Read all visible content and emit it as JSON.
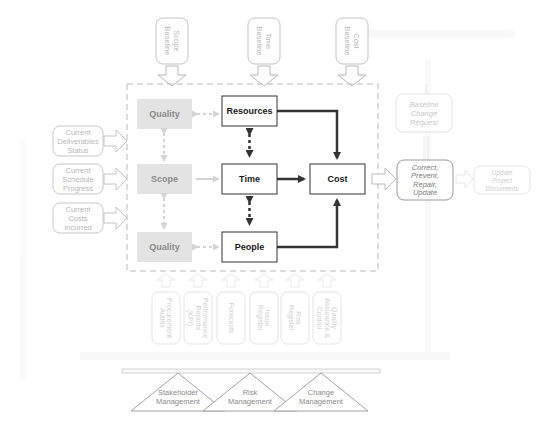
{
  "diagram": {
    "baselines": [
      {
        "label_line1": "Scope",
        "label_line2": "Baseline"
      },
      {
        "label_line1": "Time",
        "label_line2": "Baseline"
      },
      {
        "label_line1": "Cost",
        "label_line2": "Baseline"
      }
    ],
    "inputs": [
      {
        "lines": [
          "Current",
          "Deliverables",
          "Status"
        ]
      },
      {
        "lines": [
          "Current",
          "Schedule",
          "Progress"
        ]
      },
      {
        "lines": [
          "Current",
          "Costs",
          "Incurred"
        ]
      }
    ],
    "constraints": {
      "quality_top": "Quality",
      "scope": "Scope",
      "quality_bottom": "Quality"
    },
    "core": {
      "resources": "Resources",
      "time": "Time",
      "people": "People",
      "cost": "Cost"
    },
    "outputs": {
      "baseline_change_request": [
        "Baseline",
        "Change",
        "Request"
      ],
      "correct_prevent": [
        "Correct,",
        "Prevent,",
        "Repair,",
        "Update"
      ],
      "update_documents": [
        "Update",
        "Project",
        "Documents"
      ]
    },
    "tools": [
      {
        "lines": [
          "Procurement",
          "Audits"
        ]
      },
      {
        "lines": [
          "Performance",
          "Reports",
          "(KPI)"
        ]
      },
      {
        "lines": [
          "Forecasts"
        ]
      },
      {
        "lines": [
          "Issue",
          "Register"
        ]
      },
      {
        "lines": [
          "Risk",
          "Register"
        ]
      },
      {
        "lines": [
          "Quality",
          "Assurance &",
          "Control"
        ]
      }
    ],
    "foundations": [
      {
        "lines": [
          "Stakeholder",
          "Management"
        ]
      },
      {
        "lines": [
          "Risk",
          "Management"
        ]
      },
      {
        "lines": [
          "Change",
          "Management"
        ]
      }
    ]
  }
}
